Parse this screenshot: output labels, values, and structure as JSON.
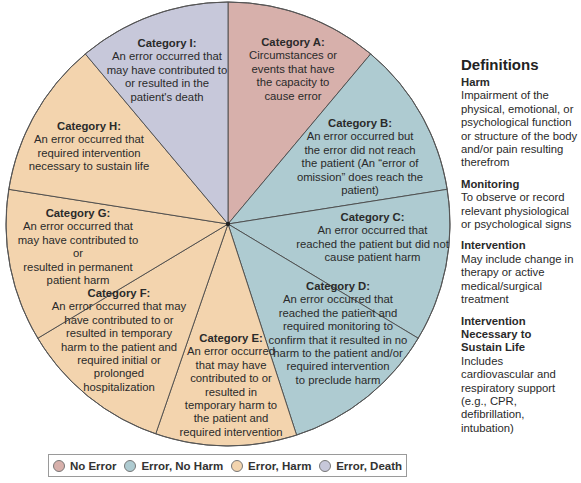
{
  "diagram": {
    "type": "pie-wheel",
    "center": [
      228,
      224
    ],
    "radius": 222,
    "colors": {
      "no_error": "#d7b0ab",
      "error_no_harm": "#aecbd1",
      "error_harm": "#f3d4ae",
      "error_death": "#c7c8da"
    },
    "segments": [
      {
        "id": "A",
        "title": "Category A:",
        "lines": [
          "Circumstances or",
          "events that have",
          "the capacity to",
          "cause error"
        ],
        "group": "no_error"
      },
      {
        "id": "B",
        "title": "Category B:",
        "lines": [
          "An error occurred but",
          "the error did not reach",
          "the patient (An “error of",
          "omission” does reach the",
          "patient)"
        ],
        "group": "error_no_harm"
      },
      {
        "id": "C",
        "title": "Category C:",
        "lines": [
          "An error occurred that",
          "reached the patient but did not",
          "cause patient harm"
        ],
        "group": "error_no_harm"
      },
      {
        "id": "D",
        "title": "Category D:",
        "lines": [
          "An error occurred that",
          "reached the patient and",
          "required monitoring to",
          "confirm that it resulted in no",
          "harm to the patient and/or",
          "required intervention",
          "to preclude harm"
        ],
        "group": "error_no_harm"
      },
      {
        "id": "E",
        "title": "Category E:",
        "lines": [
          "An error occurred",
          "that may have",
          "contributed to or",
          "resulted in",
          "temporary harm to",
          "the patient and",
          "required intervention"
        ],
        "group": "error_harm"
      },
      {
        "id": "F",
        "title": "Category F:",
        "lines": [
          "An error occurred that may",
          "have contributed to or",
          "resulted in temporary",
          "harm to the patient and",
          "required initial or",
          "prolonged",
          "hospitalization"
        ],
        "group": "error_harm"
      },
      {
        "id": "G",
        "title": "Category G:",
        "lines": [
          "An error occurred that",
          "may have contributed to or",
          "resulted in permanent",
          "patient harm"
        ],
        "group": "error_harm"
      },
      {
        "id": "H",
        "title": "Category H:",
        "lines": [
          "An error occurred that",
          "required intervention",
          "necessary to sustain life"
        ],
        "group": "error_harm"
      },
      {
        "id": "I",
        "title": "Category I:",
        "lines": [
          "An error occurred that",
          "may have contributed to",
          "or resulted in the",
          "patient's death"
        ],
        "group": "error_death"
      }
    ]
  },
  "definitions": {
    "heading": "Definitions",
    "items": [
      {
        "term": "Harm",
        "text": "Impairment of the physical, emotional, or psychological function or structure of the body and/or pain resulting therefrom"
      },
      {
        "term": "Monitoring",
        "text": "To observe or record relevant physiological or psychological signs"
      },
      {
        "term": "Intervention",
        "text": "May include change in therapy or active medical/surgical treatment"
      },
      {
        "term": "Intervention Necessary to Sustain Life",
        "text": "Includes cardiovascular and respiratory support (e.g., CPR, defibrillation, intubation)"
      }
    ]
  },
  "legend": {
    "items": [
      {
        "label": "No Error",
        "group": "no_error"
      },
      {
        "label": "Error, No Harm",
        "group": "error_no_harm"
      },
      {
        "label": "Error, Harm",
        "group": "error_harm"
      },
      {
        "label": "Error, Death",
        "group": "error_death"
      }
    ]
  }
}
